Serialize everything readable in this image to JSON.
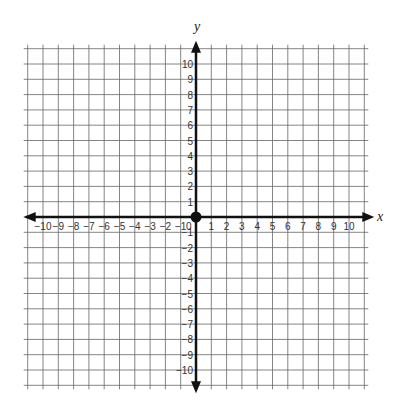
{
  "diagram": {
    "type": "coordinate-plane",
    "x_axis": {
      "label": "x",
      "min": -10,
      "max": 10,
      "ticks": [
        -10,
        -9,
        -8,
        -7,
        -6,
        -5,
        -4,
        -3,
        -2,
        -1,
        1,
        2,
        3,
        4,
        5,
        6,
        7,
        8,
        9,
        10
      ]
    },
    "y_axis": {
      "label": "y",
      "min": -10,
      "max": 10,
      "ticks": [
        -10,
        -9,
        -8,
        -7,
        -6,
        -5,
        -4,
        -3,
        -2,
        -1,
        1,
        2,
        3,
        4,
        5,
        6,
        7,
        8,
        9,
        10
      ]
    },
    "origin_label": "0",
    "origin_marker": "filled-dot",
    "grid": {
      "on": true,
      "cells_per_side": 22,
      "extent_units": 11
    },
    "colors": {
      "grid": "#555555",
      "axis": "#111111",
      "background": "#ffffff"
    }
  }
}
